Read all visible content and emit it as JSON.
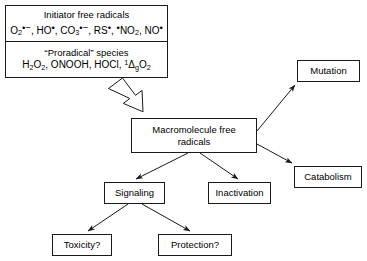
{
  "diagram": {
    "colors": {
      "stroke": "#1a1a1a",
      "background": "#ffffff",
      "text": "#000000"
    },
    "nodes": {
      "initiator": {
        "heading": "Initiator free radicals",
        "formula_plain": "O2•−, HO•, CO3•−, RS•, •NO2, NO•"
      },
      "proradical": {
        "heading": "“Proradical” species",
        "formula_plain": "H2O2, ONOOH, HOCl, 1ΔgO2"
      },
      "macromolecule": {
        "line1": "Macromolecule free",
        "line2": "radicals"
      },
      "mutation": {
        "label": "Mutation"
      },
      "catabolism": {
        "label": "Catabolism"
      },
      "signaling": {
        "label": "Signaling"
      },
      "inactivation": {
        "label": "Inactivation"
      },
      "toxicity": {
        "label": "Toxicity?"
      },
      "protection": {
        "label": "Protection?"
      }
    },
    "edges": [
      {
        "from": "proradical",
        "to": "macromolecule",
        "style": "block-arrow"
      },
      {
        "from": "macromolecule",
        "to": "mutation",
        "style": "line-arrow"
      },
      {
        "from": "macromolecule",
        "to": "catabolism",
        "style": "line-arrow"
      },
      {
        "from": "macromolecule",
        "to": "signaling",
        "style": "line-arrow"
      },
      {
        "from": "macromolecule",
        "to": "inactivation",
        "style": "line-arrow"
      },
      {
        "from": "signaling",
        "to": "toxicity",
        "style": "line-arrow"
      },
      {
        "from": "signaling",
        "to": "protection",
        "style": "line-arrow"
      }
    ]
  }
}
